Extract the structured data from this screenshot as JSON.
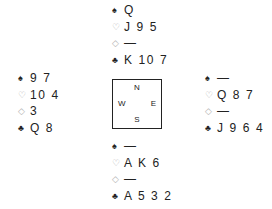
{
  "suits": {
    "spades": "♠",
    "hearts": "♡",
    "diamonds": "◇",
    "clubs": "♣"
  },
  "hands": {
    "north": {
      "spades": "Q",
      "hearts": "J 9 5",
      "diamonds": "—",
      "clubs": "K 10 7"
    },
    "west": {
      "spades": "9 7",
      "hearts": "10 4",
      "diamonds": "3",
      "clubs": "Q 8"
    },
    "east": {
      "spades": "—",
      "hearts": "Q 8 7",
      "diamonds": "—",
      "clubs": "J 9 6 4"
    },
    "south": {
      "spades": "—",
      "hearts": "A K 6",
      "diamonds": "—",
      "clubs": "A 5 3 2"
    }
  },
  "compass": {
    "north": "N",
    "south": "S",
    "west": "W",
    "east": "E"
  },
  "colors": {
    "black_suit": "#222222",
    "red_suit_outline": "#b0b0b0",
    "text": "#222222",
    "background": "#ffffff"
  }
}
